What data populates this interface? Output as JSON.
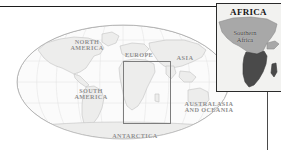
{
  "figure": {
    "kind": "locator-map-with-inset",
    "colors": {
      "ocean": "#fbfbfb",
      "land": "#ededec",
      "graticule": "#e2e2e2",
      "outline": "#bdbdbd",
      "label": "#8d8d8d",
      "highlight_rect": "#7d7d7d",
      "inset_border": "#2b2b2b",
      "inset_bg": "#f2f2f0",
      "inset_africa": "#a8a8a8",
      "inset_southern_africa": "#4a4a4a",
      "leader_line": "#4a4a4a",
      "top_rule": "#1c1c1c"
    }
  },
  "world_map": {
    "projection": "elliptical (Mollweide-style) world",
    "continent_labels": [
      {
        "id": "north-america",
        "text": "NORTH\nAMERICA"
      },
      {
        "id": "south-america",
        "text": "SOUTH\nAMERICA"
      },
      {
        "id": "europe",
        "text": "EUROPE"
      },
      {
        "id": "asia",
        "text": "ASIA"
      },
      {
        "id": "australasia-oceania",
        "text": "AUSTRALASIA\nAND OCEANIA"
      },
      {
        "id": "antarctica",
        "text": "ANTARCTICA"
      }
    ],
    "highlight": {
      "region": "Africa",
      "shape": "rectangle"
    }
  },
  "inset": {
    "title": "AFRICA",
    "subregion_label": "Southern\nAfrica"
  }
}
